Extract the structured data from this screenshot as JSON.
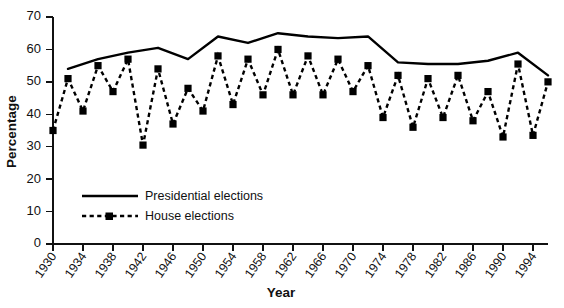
{
  "chart_data": {
    "type": "line",
    "title": "",
    "xlabel": "Year",
    "ylabel": "Percentage",
    "ylim": [
      0,
      70
    ],
    "ytick_step": 10,
    "yticks": [
      0,
      10,
      20,
      30,
      40,
      50,
      60,
      70
    ],
    "xlim": [
      1930,
      1996
    ],
    "xticks": [
      1930,
      1934,
      1938,
      1942,
      1946,
      1950,
      1954,
      1958,
      1962,
      1966,
      1970,
      1974,
      1978,
      1982,
      1986,
      1990,
      1994
    ],
    "xtick_labels": [
      "1930",
      "1934",
      "1938",
      "1942",
      "1946",
      "1950",
      "1954",
      "1958",
      "1962",
      "1966",
      "1970",
      "1974",
      "1978",
      "1982",
      "1986",
      "1990",
      "1994"
    ],
    "grid": false,
    "legend_position": "inside-lower-left",
    "series": [
      {
        "name": "Presidential elections",
        "style": "solid",
        "marker": "none",
        "color": "#000000",
        "x": [
          1932,
          1936,
          1940,
          1944,
          1948,
          1952,
          1956,
          1960,
          1964,
          1968,
          1972,
          1976,
          1980,
          1984,
          1988,
          1992,
          1996
        ],
        "values": [
          54,
          57,
          59,
          60.5,
          57,
          64,
          62,
          65,
          64,
          63.5,
          64,
          56,
          55.5,
          55.5,
          56.5,
          59,
          52
        ]
      },
      {
        "name": "House elections",
        "style": "dashed",
        "marker": "square",
        "color": "#000000",
        "x": [
          1930,
          1932,
          1934,
          1936,
          1938,
          1940,
          1942,
          1944,
          1946,
          1948,
          1950,
          1952,
          1954,
          1956,
          1958,
          1960,
          1962,
          1964,
          1966,
          1968,
          1970,
          1972,
          1974,
          1976,
          1978,
          1980,
          1982,
          1984,
          1986,
          1988,
          1990,
          1992,
          1994,
          1996
        ],
        "values": [
          35,
          51,
          41,
          55,
          47,
          57,
          30.5,
          54,
          37,
          48,
          41,
          58,
          43,
          57,
          46,
          60,
          46,
          58,
          46,
          57,
          47,
          55,
          39,
          52,
          36,
          51,
          39,
          52,
          38,
          47,
          33,
          55.5,
          33.5,
          50
        ]
      }
    ],
    "legend": [
      {
        "label": "Presidential elections",
        "style": "solid",
        "marker": "none"
      },
      {
        "label": "House elections",
        "style": "dashed",
        "marker": "square"
      }
    ]
  }
}
